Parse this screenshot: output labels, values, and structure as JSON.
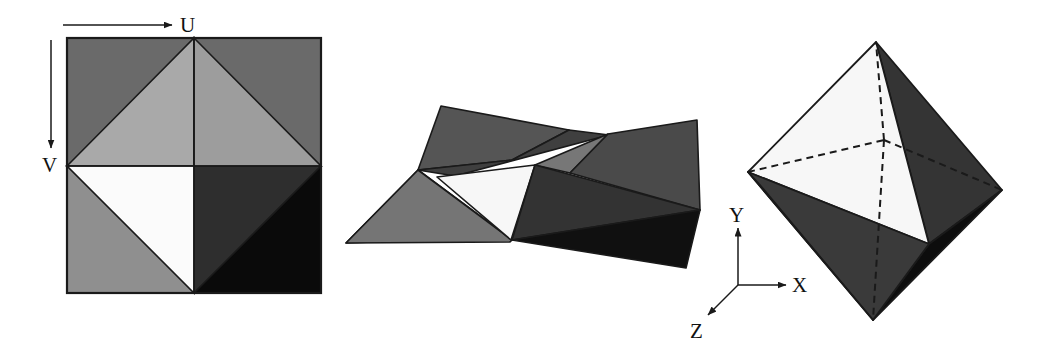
{
  "figure": {
    "background_color": "#ffffff",
    "outline_color": "#1a1a1a",
    "panels": [
      {
        "name": "uv-texture-square",
        "description": "Square texture map in UV space containing eight shaded triangles",
        "axes": [
          {
            "label": "U",
            "direction": "right"
          },
          {
            "label": "V",
            "direction": "down"
          }
        ],
        "square_bounds": {
          "x": 67,
          "y": 38,
          "width": 254,
          "height": 255
        },
        "faces": [
          {
            "id": "tl-corner-upper",
            "tone": "#6a6a6a"
          },
          {
            "id": "tr-corner-upper",
            "tone": "#6a6a6a"
          },
          {
            "id": "top-left-triangle",
            "tone": "#a9a9a9"
          },
          {
            "id": "top-right-triangle",
            "tone": "#9d9d9d"
          },
          {
            "id": "bottom-left-corner",
            "tone": "#8f8f8f"
          },
          {
            "id": "bottom-left-white-triangle",
            "tone": "#fbfbfb"
          },
          {
            "id": "bottom-right-dark-triangle",
            "tone": "#2e2e2e"
          },
          {
            "id": "bottom-right-black-triangle",
            "tone": "#0a0a0a"
          }
        ]
      },
      {
        "name": "partially-folded-net",
        "description": "Intermediate folding stage of the eight triangular faces",
        "faces": [
          {
            "id": "upper-left-large",
            "tone": "#555555"
          },
          {
            "id": "upper-left-sliver",
            "tone": "#3f3f3f"
          },
          {
            "id": "left-lower-mid",
            "tone": "#757575"
          },
          {
            "id": "white-center",
            "tone": "#f7f7f7"
          },
          {
            "id": "mid-gray-wedge",
            "tone": "#777777"
          },
          {
            "id": "upper-right-large",
            "tone": "#4a4a4a"
          },
          {
            "id": "center-dark",
            "tone": "#333333"
          },
          {
            "id": "lower-right-black",
            "tone": "#101010"
          }
        ]
      },
      {
        "name": "assembled-octahedron",
        "description": "Completed octahedron shown in XYZ world space with hidden edges dashed",
        "axes": [
          {
            "label": "X",
            "direction": "right"
          },
          {
            "label": "Y",
            "direction": "up"
          },
          {
            "label": "Z",
            "direction": "down-left"
          }
        ],
        "vertices": {
          "top": [
            876,
            42
          ],
          "bottom": [
            873,
            320
          ],
          "left": [
            748,
            172
          ],
          "right": [
            1002,
            190
          ],
          "front": [
            929,
            244
          ],
          "back_hidden": [
            884,
            140
          ]
        },
        "faces": [
          {
            "id": "top-left-white",
            "tone": "#f7f7f7"
          },
          {
            "id": "top-right-dark",
            "tone": "#343434"
          },
          {
            "id": "bottom-right-black",
            "tone": "#0d0d0d"
          },
          {
            "id": "bottom-left-gray",
            "tone": "#8a8a8a"
          },
          {
            "id": "bottom-left-edge-dark",
            "tone": "#3a3a3a"
          }
        ],
        "hidden_edge_style": "dashed"
      }
    ]
  }
}
